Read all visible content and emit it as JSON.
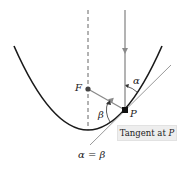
{
  "diagram": {
    "labels": {
      "focus": "F",
      "point": "P",
      "alpha": "α",
      "beta": "β",
      "tangent_prefix": "Tangent at ",
      "tangent_point": "P",
      "formula": "α = β"
    },
    "colors": {
      "curve": "#1a1a1a",
      "ray": "#8a8a8a",
      "tangent": "#9a9a9a",
      "axis": "#555555",
      "label_box": "#eeeeee"
    },
    "points": {
      "F": [
        88,
        89
      ],
      "P": [
        125,
        110
      ],
      "vertex": [
        88,
        130
      ]
    }
  }
}
